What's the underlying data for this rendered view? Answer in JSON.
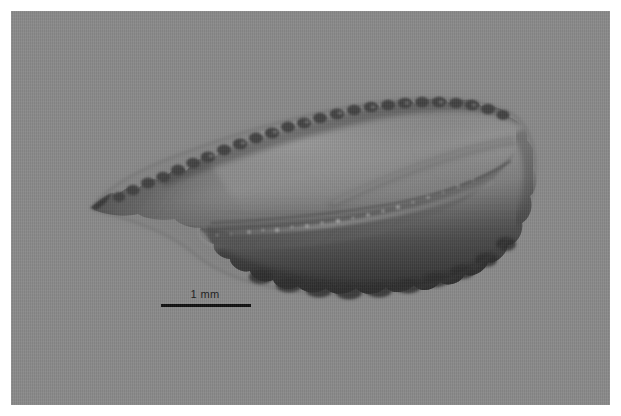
{
  "figure": {
    "domain_kind": "micrograph",
    "view": "medial-face",
    "orientation": "rostrum-left-postrostrum-right",
    "plate_background_color": "#8a8a8a",
    "page_background_color": "#ffffff",
    "margin_px": 11,
    "plate_width_px": 599,
    "plate_height_px": 394
  },
  "scale_bar": {
    "label": "1 mm",
    "bar_length_px": 90,
    "bar_thickness_px": 3,
    "bar_color": "#101010",
    "label_color": "#1c1c1c",
    "position": "lower-left"
  },
  "specimen": {
    "name": "otolith",
    "outline_description": "elongate lanceolate otolith with pointed rostrum at left, crenulated dorsal margin, lobed ventral margin, and broadly rounded posterior margin at right",
    "bounding_box_px": {
      "x": 88,
      "y": 96,
      "width": 437,
      "height": 193
    },
    "features": [
      {
        "name": "rostrum",
        "label": "rostrum",
        "position_px": {
          "x": 92,
          "y": 206
        }
      },
      {
        "name": "dorsal-margin",
        "label": "crenulated dorsal margin",
        "position_px": {
          "x": 300,
          "y": 112
        }
      },
      {
        "name": "ventral-margin",
        "label": "lobed ventral margin",
        "position_px": {
          "x": 330,
          "y": 272
        }
      },
      {
        "name": "posterior-margin",
        "label": "rounded posterior margin",
        "position_px": {
          "x": 505,
          "y": 195
        }
      },
      {
        "name": "sulcus-acusticus",
        "label": "sulcus acusticus",
        "position_px": {
          "x": 350,
          "y": 198
        }
      },
      {
        "name": "excisura",
        "label": "excisura notch",
        "position_px": {
          "x": 196,
          "y": 236
        }
      }
    ],
    "tones": {
      "body_light": "#8e8e8e",
      "body_mid": "#7a7a7a",
      "body_dark": "#5e5e5e",
      "body_darkest": "#3c3c3c",
      "edge_shadow": "#2e2e2e",
      "highlight": "#a6a6a6"
    }
  }
}
